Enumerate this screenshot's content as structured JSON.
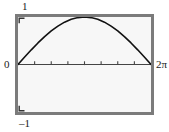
{
  "figure": {
    "background_color": "#ffffff",
    "frame_color": "#7b7b7b",
    "plot_background_color": "#f7f7f7",
    "curve_color": "#111111",
    "axis_color": "#444444"
  },
  "labels": {
    "y_max": "1",
    "y_min": "–1",
    "x_min": "0",
    "x_max": "2π"
  },
  "chart_data": {
    "type": "line",
    "title": "",
    "xlabel": "",
    "ylabel": "",
    "xlim": [
      0,
      6.283185307179586
    ],
    "ylim": [
      -1,
      1
    ],
    "grid": false,
    "legend": null,
    "x_tick_labels": [
      "0",
      "2π"
    ],
    "y_tick_labels": [
      "–1",
      "1"
    ],
    "x_tick_count": 7,
    "y_tick_positions": [
      -1,
      1
    ],
    "series": [
      {
        "name": "y = sin(x/2)",
        "x": [
          0,
          0.3141592653589793,
          0.6283185307179586,
          0.9424777960769379,
          1.2566370614359172,
          1.5707963267948966,
          1.8849555921538759,
          2.199114857512855,
          2.5132741228718345,
          2.827433388230814,
          3.141592653589793,
          3.455751918948772,
          3.7699111843077517,
          4.084070449666731,
          4.39822971502571,
          4.71238898038469,
          5.026548245743669,
          5.340707511102648,
          5.654866776461628,
          5.969026041820607,
          6.283185307179586
        ],
        "y": [
          0,
          0.1564,
          0.309,
          0.454,
          0.5878,
          0.7071,
          0.809,
          0.891,
          0.9511,
          0.9877,
          1.0,
          0.9877,
          0.9511,
          0.891,
          0.809,
          0.7071,
          0.5878,
          0.454,
          0.309,
          0.1564,
          0
        ]
      }
    ],
    "annotations": []
  }
}
